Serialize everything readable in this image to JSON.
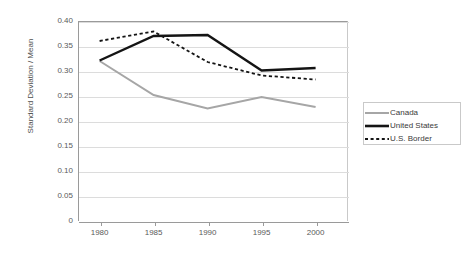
{
  "chart_data": {
    "type": "line",
    "title": "",
    "xlabel": "",
    "ylabel": "Standard Deviation / Mean",
    "x": [
      1980,
      1985,
      1990,
      1995,
      2000
    ],
    "categories": [
      "1980",
      "1985",
      "1990",
      "1995",
      "2000"
    ],
    "xlim": [
      1978,
      2003
    ],
    "ylim": [
      0,
      0.4
    ],
    "yticks": [
      0,
      0.05,
      0.1,
      0.15,
      0.2,
      0.25,
      0.3,
      0.35,
      0.4
    ],
    "ytick_labels": [
      "0",
      "0.05",
      "0.10",
      "0.15",
      "0.20",
      "0.25",
      "0.30",
      "0.35",
      "0.40"
    ],
    "grid": "horizontal",
    "legend_position": "right",
    "series": [
      {
        "name": "Canada",
        "values": [
          0.32,
          0.252,
          0.225,
          0.248,
          0.228
        ],
        "color": "#a6a6a6",
        "style": "solid",
        "width": 2.0
      },
      {
        "name": "United States",
        "values": [
          0.321,
          0.37,
          0.372,
          0.301,
          0.306
        ],
        "color": "#141414",
        "style": "solid",
        "width": 2.4
      },
      {
        "name": "U.S. Border",
        "values": [
          0.36,
          0.379,
          0.318,
          0.291,
          0.283
        ],
        "color": "#141414",
        "style": "dashed",
        "width": 1.8
      }
    ]
  },
  "axis": {
    "y_title": "Standard Deviation / Mean",
    "y_labels": [
      "0.40",
      "0.35",
      "0.30",
      "0.25",
      "0.20",
      "0.15",
      "0.10",
      "0.05",
      "0"
    ],
    "x_labels": [
      "1980",
      "1985",
      "1990",
      "1995",
      "2000"
    ]
  },
  "legend": {
    "items": [
      {
        "label": "Canada",
        "color": "#a6a6a6",
        "style": "solid"
      },
      {
        "label": "United States",
        "color": "#141414",
        "style": "solid"
      },
      {
        "label": "U.S. Border",
        "color": "#141414",
        "style": "dashed"
      }
    ]
  },
  "colors": {
    "canada": "#a6a6a6",
    "united_states": "#141414",
    "us_border": "#141414",
    "grid": "#dcdcdc",
    "axis": "#9a9a9a",
    "background": "#ffffff"
  }
}
